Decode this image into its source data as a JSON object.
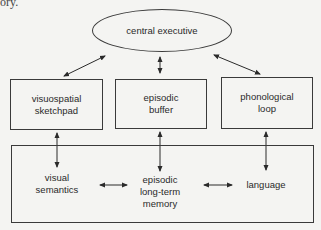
{
  "background_text": {
    "first_line_fragment": "ory."
  },
  "diagram": {
    "top": {
      "label": "central executive"
    },
    "middle_boxes": [
      {
        "id": "visuospatial",
        "line1": "visuospatial",
        "line2": "sketchpad"
      },
      {
        "id": "episodic-buffer",
        "line1": "episodic",
        "line2": "buffer"
      },
      {
        "id": "phonological",
        "line1": "phonological",
        "line2": "loop"
      }
    ],
    "bottom_box": {
      "items": [
        {
          "id": "visual-semantics",
          "line1": "visual",
          "line2": "semantics"
        },
        {
          "id": "episodic-ltm",
          "line1": "episodic",
          "line2": "long-term",
          "line3": "memory"
        },
        {
          "id": "language",
          "line1": "language"
        }
      ]
    },
    "connections": [
      "central executive ↔ visuospatial sketchpad",
      "central executive ↔ episodic buffer",
      "central executive ↔ phonological loop",
      "visuospatial sketchpad ↔ visual semantics",
      "episodic buffer ↔ episodic long-term memory",
      "phonological loop ↔ language",
      "visual semantics ↔ episodic long-term memory",
      "episodic long-term memory ↔ language"
    ]
  }
}
